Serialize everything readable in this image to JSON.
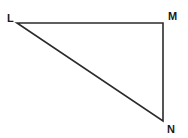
{
  "figure": {
    "name": "triangle-lmn",
    "shape_type": "right triangle",
    "background_color": "#ffffff",
    "stroke_color": "#2b2b2b",
    "stroke_width": 1.6,
    "canvas": {
      "width": 188,
      "height": 138
    },
    "vertices": [
      {
        "id": "L",
        "label": "L",
        "x": 17,
        "y": 23,
        "label_x": 7,
        "label_y": 13
      },
      {
        "id": "M",
        "label": "M",
        "x": 163,
        "y": 23,
        "label_x": 168,
        "label_y": 11
      },
      {
        "id": "N",
        "label": "N",
        "x": 163,
        "y": 121,
        "label_x": 167,
        "label_y": 124
      }
    ],
    "edges": [
      {
        "id": "LM",
        "from": "L",
        "to": "M",
        "orientation": "horizontal"
      },
      {
        "id": "MN",
        "from": "M",
        "to": "N",
        "orientation": "vertical"
      },
      {
        "id": "NL",
        "from": "N",
        "to": "L",
        "orientation": "diagonal"
      }
    ],
    "polygon_points": "17,23 163,23 163,121"
  }
}
